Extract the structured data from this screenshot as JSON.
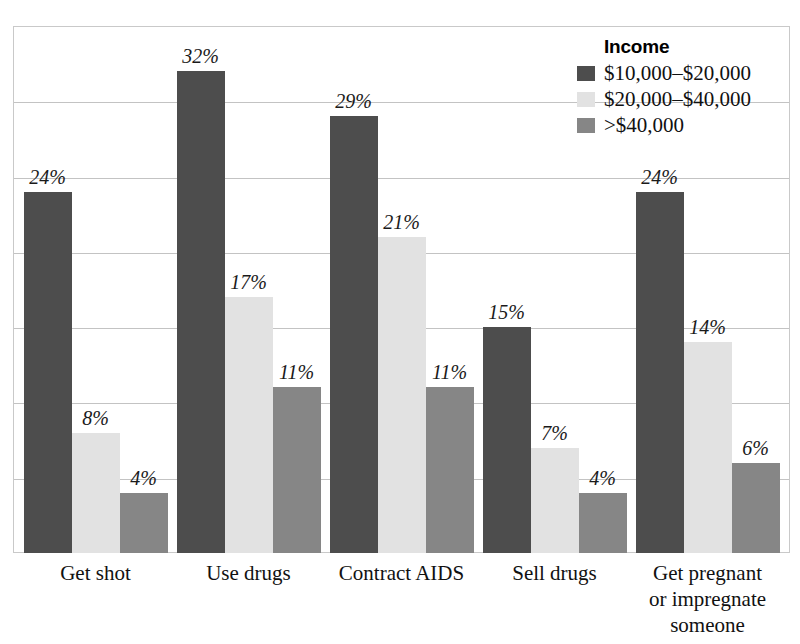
{
  "chart_data": {
    "type": "bar",
    "title": "",
    "subtitle": "",
    "xlabel": "",
    "ylabel": "",
    "ylim": [
      0,
      35
    ],
    "grid": true,
    "gridline_interval": 5,
    "legend_position": "top-right",
    "legend_title": "Income",
    "categories": [
      "Get shot",
      "Use drugs",
      "Contract AIDS",
      "Sell drugs",
      "Get pregnant or impregnate someone"
    ],
    "category_lines": [
      [
        "Get shot"
      ],
      [
        "Use drugs"
      ],
      [
        "Contract AIDS"
      ],
      [
        "Sell drugs"
      ],
      [
        "Get pregnant",
        "or impregnate",
        "someone"
      ]
    ],
    "series": [
      {
        "name": "$10,000–$20,000",
        "color": "#4d4d4d",
        "values": [
          24,
          32,
          29,
          15,
          24
        ],
        "labels": [
          "24%",
          "32%",
          "29%",
          "15%",
          "24%"
        ]
      },
      {
        "name": "$20,000–$40,000",
        "color": "#e2e2e2",
        "values": [
          8,
          17,
          21,
          7,
          14
        ],
        "labels": [
          "8%",
          "17%",
          "21%",
          "7%",
          "14%"
        ]
      },
      {
        "name": ">$40,000",
        "color": "#868686",
        "values": [
          4,
          11,
          11,
          4,
          6
        ],
        "labels": [
          "4%",
          "11%",
          "11%",
          "4%",
          "6%"
        ]
      }
    ]
  },
  "legend": {
    "title": "Income",
    "entries": [
      {
        "label": "$10,000–$20,000",
        "color": "#4d4d4d"
      },
      {
        "label": "$20,000–$40,000",
        "color": "#e2e2e2"
      },
      {
        "label": ">$40,000",
        "color": "#868686"
      }
    ]
  },
  "axis": {
    "gridline_count": 7
  }
}
